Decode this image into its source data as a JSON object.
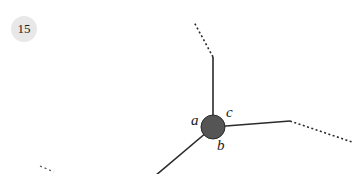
{
  "badge": {
    "number": "15"
  },
  "diagram": {
    "labels": {
      "a": "a",
      "b": "b",
      "c": "c"
    },
    "colors": {
      "vertex": "#555555",
      "edge": "#2a2a2a",
      "badge_bg": "#e8e8e8"
    }
  }
}
